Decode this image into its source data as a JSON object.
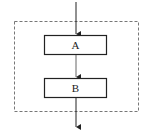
{
  "diagram": {
    "type": "flowchart-sequence",
    "container": {
      "style": "dashed"
    },
    "nodes": [
      {
        "id": "A",
        "label": "A"
      },
      {
        "id": "B",
        "label": "B"
      }
    ],
    "edges": [
      {
        "from": "entry",
        "to": "A"
      },
      {
        "from": "A",
        "to": "B"
      },
      {
        "from": "B",
        "to": "exit"
      }
    ],
    "colors": {
      "stroke": "#222222",
      "dashed": "#777777",
      "background": "#ffffff"
    }
  }
}
